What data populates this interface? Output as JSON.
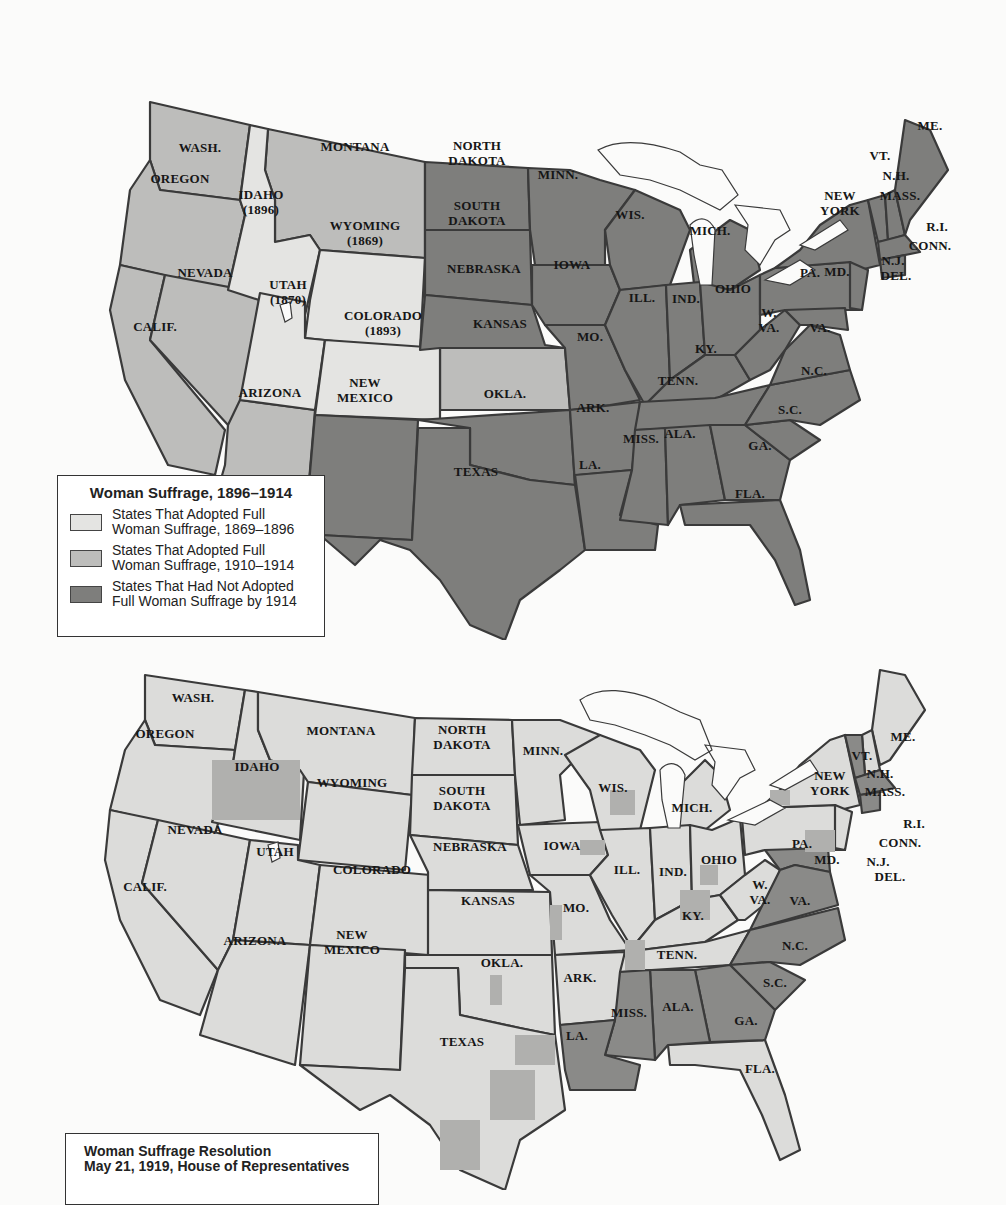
{
  "colors": {
    "adopted_1869_1896": "#e4e4e2",
    "adopted_1910_1914": "#bdbdbb",
    "not_adopted_by_1914": "#7e7e7c",
    "resolution_yes": "#dcdcda",
    "resolution_no": "#8a8a88",
    "resolution_mixed": "#b0b0ae",
    "border": "#3a3a3a",
    "background": "#fbfbfa"
  },
  "map1": {
    "legend": {
      "title": "Woman Suffrage, 1896–1914",
      "items": [
        {
          "label_line1": "States That Adopted Full",
          "label_line2": "Woman Suffrage, 1869–1896",
          "color": "#e4e4e2"
        },
        {
          "label_line1": "States That Adopted Full",
          "label_line2": "Woman Suffrage, 1910–1914",
          "color": "#bdbdbb"
        },
        {
          "label_line1": "States That Had Not Adopted",
          "label_line2": "Full Woman Suffrage by 1914",
          "color": "#7e7e7c"
        }
      ]
    },
    "labels": {
      "wash": "WASH.",
      "oregon": "OREGON",
      "calif": "CALIF.",
      "nevada": "NEVADA",
      "idaho": "IDAHO",
      "idaho_year": "(1896)",
      "montana": "MONTANA",
      "wyoming": "WYOMING",
      "wyoming_year": "(1869)",
      "utah": "UTAH",
      "utah_year": "(1870)",
      "colorado": "COLORADO",
      "colorado_year": "(1893)",
      "arizona": "ARIZONA",
      "new_mexico_1": "NEW",
      "new_mexico_2": "MEXICO",
      "north_dakota_1": "NORTH",
      "north_dakota_2": "DAKOTA",
      "south_dakota_1": "SOUTH",
      "south_dakota_2": "DAKOTA",
      "nebraska": "NEBRASKA",
      "kansas": "KANSAS",
      "okla": "OKLA.",
      "texas": "TEXAS",
      "minn": "MINN.",
      "iowa": "IOWA",
      "mo": "MO.",
      "ark": "ARK.",
      "la": "LA.",
      "wis": "WIS.",
      "ill": "ILL.",
      "mich": "MICH.",
      "ind": "IND.",
      "ohio": "OHIO",
      "ky": "KY.",
      "tenn": "TENN.",
      "miss": "MISS.",
      "ala": "ALA.",
      "ga": "GA.",
      "fla": "FLA.",
      "sc": "S.C.",
      "nc": "N.C.",
      "va": "VA.",
      "wva_1": "W.",
      "wva_2": "VA.",
      "pa": "PA.",
      "new_york_1": "NEW",
      "new_york_2": "YORK",
      "vt": "VT.",
      "nh": "N.H.",
      "me": "ME.",
      "mass": "MASS.",
      "ri": "R.I.",
      "conn": "CONN.",
      "nj": "N.J.",
      "md": "MD.",
      "del": "DEL."
    }
  },
  "map2": {
    "legend": {
      "title_line1": "Woman Suffrage Resolution",
      "title_line2": "May 21, 1919, House of Representatives"
    },
    "labels": {
      "wash": "WASH.",
      "oregon": "OREGON",
      "calif": "CALIF.",
      "nevada": "NEVADA",
      "idaho": "IDAHO",
      "montana": "MONTANA",
      "wyoming": "WYOMING",
      "utah": "UTAH",
      "colorado": "COLORADO",
      "arizona": "ARIZONA",
      "new_mexico_1": "NEW",
      "new_mexico_2": "MEXICO",
      "north_dakota_1": "NORTH",
      "north_dakota_2": "DAKOTA",
      "south_dakota_1": "SOUTH",
      "south_dakota_2": "DAKOTA",
      "nebraska": "NEBRASKA",
      "kansas": "KANSAS",
      "okla": "OKLA.",
      "texas": "TEXAS",
      "minn": "MINN.",
      "iowa": "IOWA",
      "mo": "MO.",
      "ark": "ARK.",
      "la": "LA.",
      "wis": "WIS.",
      "ill": "ILL.",
      "mich": "MICH.",
      "ind": "IND.",
      "ohio": "OHIO",
      "ky": "KY.",
      "tenn": "TENN.",
      "miss": "MISS.",
      "ala": "ALA.",
      "ga": "GA.",
      "fla": "FLA.",
      "sc": "S.C.",
      "nc": "N.C.",
      "va": "VA.",
      "wva_1": "W.",
      "wva_2": "VA.",
      "pa": "PA.",
      "new_york_1": "NEW",
      "new_york_2": "YORK",
      "vt": "VT.",
      "nh": "N.H.",
      "me": "ME.",
      "mass": "MASS.",
      "ri": "R.I.",
      "conn": "CONN.",
      "nj": "N.J.",
      "md": "MD.",
      "del": "DEL."
    }
  }
}
